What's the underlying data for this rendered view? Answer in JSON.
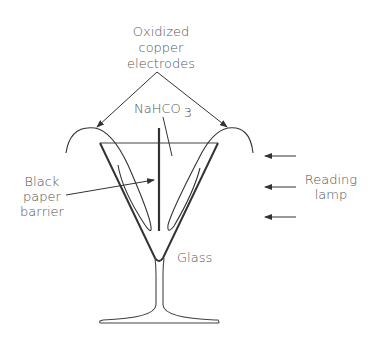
{
  "diagram": {
    "labels": {
      "electrodes": [
        "Oxidized",
        "copper",
        "electrodes"
      ],
      "solution": "NaHCO",
      "solution_subscript": "3",
      "barrier": [
        "Black",
        "paper",
        "barrier"
      ],
      "lamp": [
        "Reading",
        "lamp"
      ],
      "glass": "Glass"
    },
    "colors": {
      "line": "#333333",
      "text": "#555555",
      "background": "#ffffff"
    }
  }
}
